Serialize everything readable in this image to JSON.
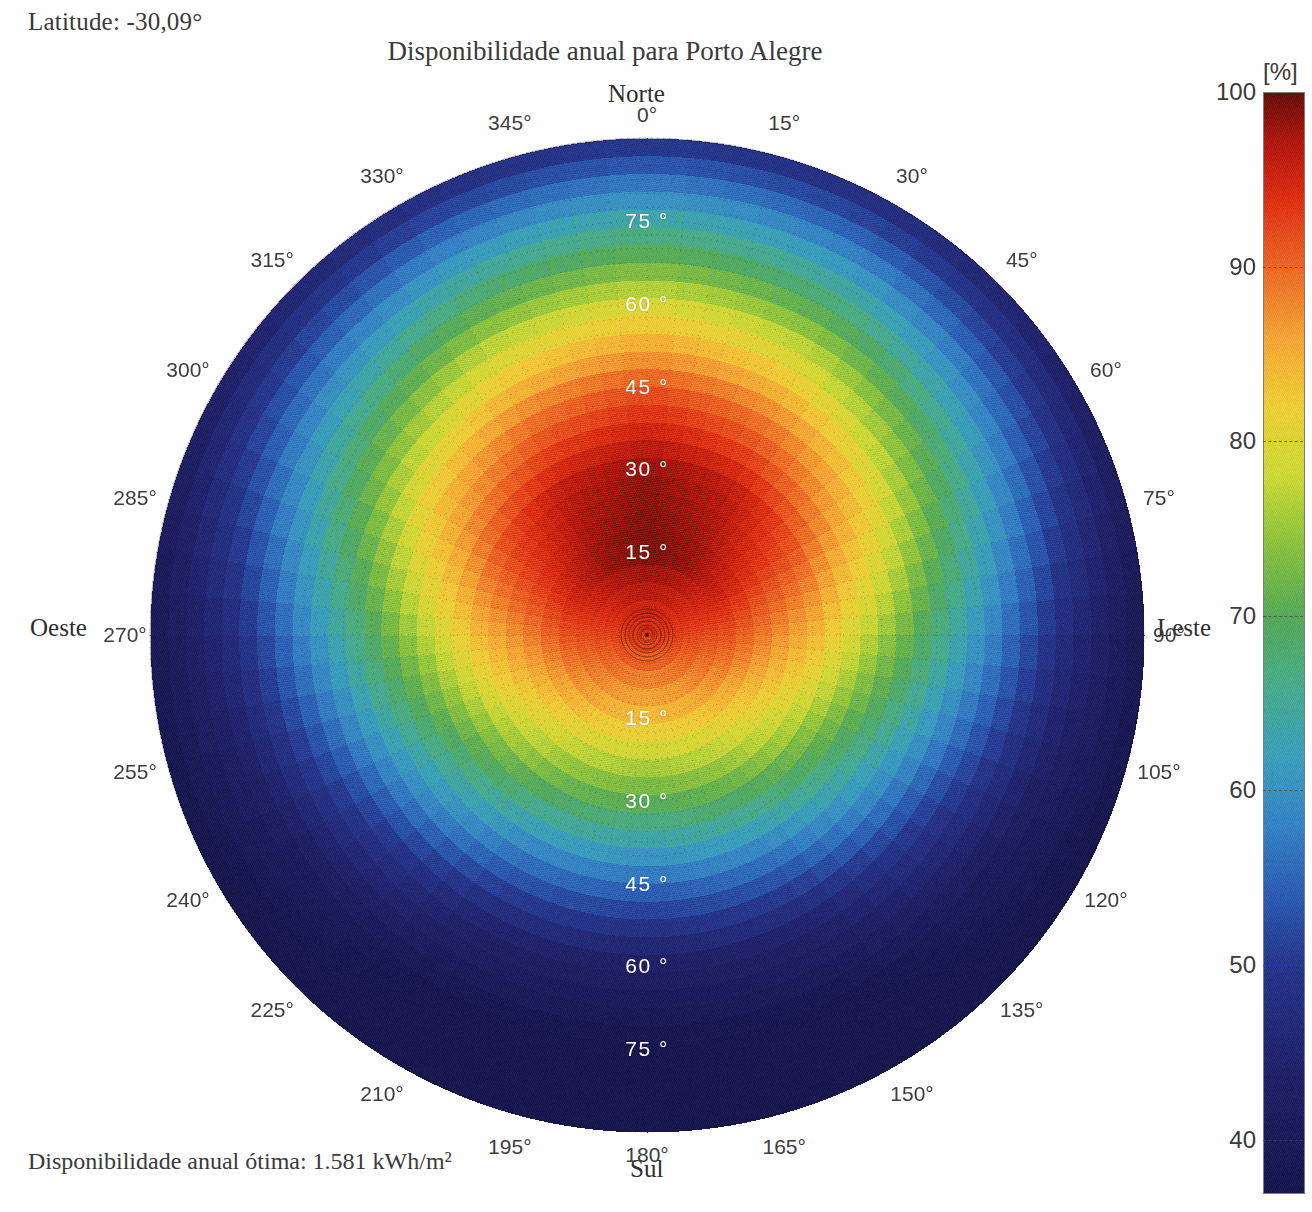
{
  "header": {
    "latitude_label": "Latitude: -30,09°",
    "title": "Disponibilidade anual para Porto Alegre"
  },
  "footer": {
    "optimal_label": "Disponibilidade anual ótima: 1.581 kWh/m²"
  },
  "cardinals": {
    "north": "Norte",
    "south": "Sul",
    "west": "Oeste",
    "east": "Leste"
  },
  "colorbar": {
    "unit": "[%]",
    "ticks": [
      100,
      90,
      80,
      70,
      60,
      50,
      40
    ],
    "min": 37,
    "max": 100,
    "tick_labels": [
      "100",
      "90",
      "80",
      "70",
      "60",
      "50",
      "40"
    ]
  },
  "chart_data": {
    "type": "heatmap",
    "projection": "polar",
    "title": "Disponibilidade anual para Porto Alegre",
    "subtitle": "Latitude: -30,09°",
    "annotation": "Disponibilidade anual ótima: 1.581 kWh/m²",
    "colorbar_label": "[%]",
    "zlim": [
      37,
      100
    ],
    "theta_label": "Azimute",
    "theta_unit": "°",
    "theta_ticks": [
      0,
      15,
      30,
      45,
      60,
      75,
      90,
      105,
      120,
      135,
      150,
      165,
      180,
      195,
      210,
      225,
      240,
      255,
      270,
      285,
      300,
      315,
      330,
      345
    ],
    "theta_tick_labels": [
      "0°",
      "15°",
      "30°",
      "45°",
      "60°",
      "75°",
      "90°",
      "105°",
      "120°",
      "135°",
      "150°",
      "165°",
      "180°",
      "195°",
      "210°",
      "225°",
      "240°",
      "255°",
      "270°",
      "285°",
      "300°",
      "315°",
      "330°",
      "345°"
    ],
    "theta_cardinal_labels": {
      "0": "Norte",
      "90": "Leste",
      "180": "Sul",
      "270": "Oeste"
    },
    "r_label": "Inclinação",
    "r_unit": "°",
    "r_ticks": [
      15,
      30,
      45,
      60,
      75
    ],
    "r_tick_labels": [
      "15 °",
      "30 °",
      "45 °",
      "60 °",
      "75 °"
    ],
    "r_max": 90,
    "grid": true,
    "optimum": {
      "azimuth_deg": 0,
      "tilt_deg": 22,
      "availability_pct": 100,
      "annual_kwh_m2": 1581
    },
    "colormap": "jet-like (dark navy 37% → blue → green → yellow → orange → red → dark red 100%)",
    "colormap_stops": [
      {
        "pct": 37,
        "hex": "#1b1b52"
      },
      {
        "pct": 44,
        "hex": "#25256d"
      },
      {
        "pct": 50,
        "hex": "#2a3a8f"
      },
      {
        "pct": 54,
        "hex": "#2f5fb5"
      },
      {
        "pct": 58,
        "hex": "#3a86c8"
      },
      {
        "pct": 62,
        "hex": "#3fa3bf"
      },
      {
        "pct": 66,
        "hex": "#4cae8f"
      },
      {
        "pct": 70,
        "hex": "#59ad5c"
      },
      {
        "pct": 74,
        "hex": "#8cc443"
      },
      {
        "pct": 78,
        "hex": "#cfdc3b"
      },
      {
        "pct": 82,
        "hex": "#f2d23c"
      },
      {
        "pct": 86,
        "hex": "#f7a83a"
      },
      {
        "pct": 90,
        "hex": "#ef6c2a"
      },
      {
        "pct": 94,
        "hex": "#e03218"
      },
      {
        "pct": 97,
        "hex": "#b81d12"
      },
      {
        "pct": 100,
        "hex": "#6b1410"
      }
    ],
    "availability_by_azimuth_tilt": {
      "tilt_deg": [
        0,
        15,
        30,
        45,
        60,
        75,
        90
      ],
      "azimuth_deg": [
        0,
        30,
        60,
        90,
        120,
        150,
        180,
        210,
        240,
        270,
        300,
        330
      ],
      "values_pct": [
        [
          94,
          100,
          99,
          92,
          80,
          65,
          49
        ],
        [
          94,
          99,
          97,
          89,
          77,
          62,
          47
        ],
        [
          94,
          96,
          92,
          83,
          70,
          56,
          43
        ],
        [
          94,
          92,
          85,
          74,
          61,
          48,
          39
        ],
        [
          94,
          88,
          78,
          65,
          52,
          42,
          37
        ],
        [
          94,
          85,
          73,
          58,
          45,
          38,
          37
        ],
        [
          94,
          84,
          71,
          56,
          43,
          37,
          37
        ],
        [
          94,
          85,
          73,
          58,
          45,
          38,
          37
        ],
        [
          94,
          88,
          78,
          65,
          52,
          42,
          37
        ],
        [
          94,
          92,
          85,
          74,
          61,
          48,
          39
        ],
        [
          94,
          96,
          92,
          83,
          70,
          56,
          43
        ],
        [
          94,
          99,
          97,
          89,
          77,
          62,
          47
        ]
      ]
    }
  },
  "polar_axis_labels": {
    "azimuth": [
      "0°",
      "15°",
      "30°",
      "45°",
      "60°",
      "75°",
      "90°",
      "105°",
      "120°",
      "135°",
      "150°",
      "165°",
      "180°",
      "195°",
      "210°",
      "225°",
      "240°",
      "255°",
      "270°",
      "285°",
      "300°",
      "315°",
      "330°",
      "345°"
    ],
    "radial_north": [
      "15 °",
      "30 °",
      "45 °",
      "60 °",
      "75 °"
    ],
    "radial_south": [
      "15 °",
      "30 °",
      "45 °",
      "60 °",
      "75 °"
    ]
  }
}
